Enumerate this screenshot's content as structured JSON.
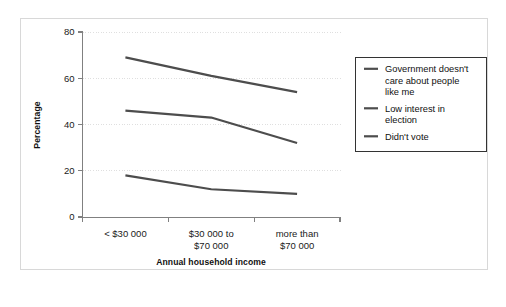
{
  "chart_data": {
    "type": "line",
    "title": "",
    "xlabel": "Annual household income",
    "ylabel": "Percentage",
    "categories": [
      "< $30 000",
      "$30 000 to\n$70 000",
      "more than\n$70 000"
    ],
    "category_lines": [
      [
        "< $30 000"
      ],
      [
        "$30 000 to",
        "$70 000"
      ],
      [
        "more than",
        "$70 000"
      ]
    ],
    "ylim": [
      0,
      80
    ],
    "yticks": [
      0,
      20,
      40,
      60,
      80
    ],
    "ytick_labels": [
      "0",
      "20",
      "40",
      "60",
      "80"
    ],
    "grid": "horizontal-dotted",
    "legend_position": "right-outside",
    "series": [
      {
        "name": "Government doesn't care about people like me",
        "name_lines": [
          "Government doesn't",
          "care about people",
          "like me"
        ],
        "values": [
          69,
          61,
          54
        ],
        "color": "#4d4d4d"
      },
      {
        "name": "Low interest in election",
        "name_lines": [
          "Low interest in",
          "election"
        ],
        "values": [
          46,
          43,
          32
        ],
        "color": "#4d4d4d"
      },
      {
        "name": "Didn't vote",
        "name_lines": [
          "Didn't vote"
        ],
        "values": [
          18,
          12,
          10
        ],
        "color": "#4d4d4d"
      }
    ]
  },
  "figure": {
    "background_color": "#ffffff",
    "frame_color": "#d8d8d8",
    "axis_color": "#808080",
    "grid_color": "#dcdcdc",
    "line_color": "#4d4d4d"
  }
}
